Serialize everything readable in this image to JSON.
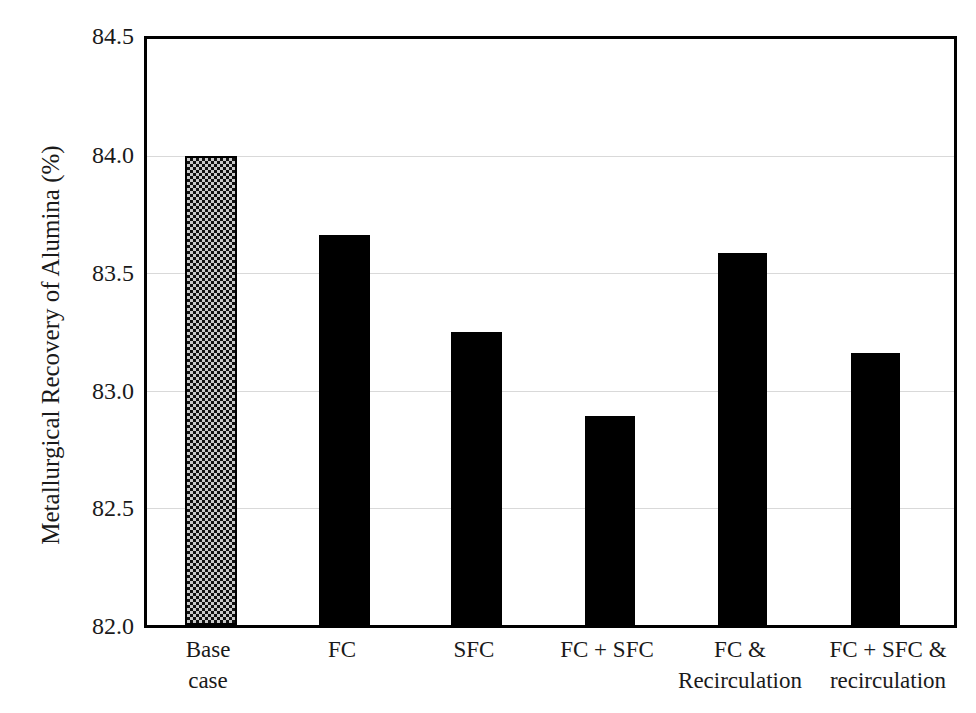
{
  "chart_data": {
    "type": "bar",
    "title": "",
    "xlabel": "",
    "ylabel": "Metallurgical Recovery of Alumina (%)",
    "ylim": [
      82.0,
      84.5
    ],
    "yticks": [
      "84.5",
      "84.0",
      "83.5",
      "83.0",
      "82.5",
      "82.0"
    ],
    "ytick_values": [
      84.5,
      84.0,
      83.5,
      83.0,
      82.5,
      82.0
    ],
    "grid": "horizontal",
    "legend": "none",
    "categories": [
      "Base case",
      "FC",
      "SFC",
      "FC + SFC",
      "FC & Recirculation",
      "FC + SFC & recirculation"
    ],
    "category_lines": [
      [
        "Base",
        "case"
      ],
      [
        "FC"
      ],
      [
        "SFC"
      ],
      [
        "FC + SFC"
      ],
      [
        "FC &",
        "Recirculation"
      ],
      [
        "FC + SFC &",
        "recirculation"
      ]
    ],
    "values": [
      84.0,
      83.665,
      83.25,
      82.89,
      83.585,
      83.16
    ],
    "bar_styles": [
      "checkerboard-hatch",
      "solid-black",
      "solid-black",
      "solid-black",
      "solid-black",
      "solid-black"
    ],
    "colors": {
      "bar_solid": "#000000",
      "bar_hatch_dark": "#111111",
      "bar_hatch_light": "#c9c9c9",
      "axis": "#000000",
      "gridline": "#d9d9d9",
      "text": "#1a1a1a",
      "background": "#ffffff"
    }
  }
}
